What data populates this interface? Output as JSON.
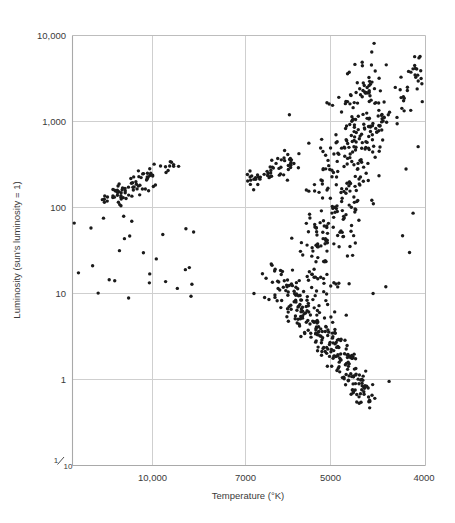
{
  "figure": {
    "background_color": "#ffffff",
    "point_color": "#1a1a1a",
    "grid_color": "#cfcfcf",
    "frame_color": "#b5b5b5",
    "point_radius": 1.7
  },
  "chart_data": {
    "type": "scatter",
    "title": "",
    "subtitle": "",
    "xlabel": "Temperature (°K)",
    "ylabel": "Luminosity (sun's luminosity = 1)",
    "xscale": "log-reversed",
    "yscale": "log",
    "xlim": [
      14500,
      3900
    ],
    "ylim": [
      0.1,
      10000
    ],
    "grid": true,
    "legend": null,
    "annotations": [],
    "xticks": [
      10000,
      7000,
      5000,
      4000
    ],
    "xticklabels": [
      "10,000",
      "7000",
      "5000",
      "4000"
    ],
    "yticks": [
      10000,
      1000,
      100,
      10,
      1,
      0.1
    ],
    "yticklabels": [
      "10,000",
      "1,000",
      "100",
      "10",
      "1",
      "1/10"
    ],
    "ytick_last_is_fraction": true,
    "ytick_fraction": {
      "numerator": "1",
      "denominator": "10"
    },
    "series_name": "stars",
    "n_points": 760,
    "clusters": [
      {
        "name": "horizontal-branch",
        "x_range": [
          11800,
          9500
        ],
        "y_range": [
          110,
          330
        ],
        "count": 78
      },
      {
        "name": "main-sequence-upper",
        "x_range": [
          7200,
          6200
        ],
        "y_range": [
          180,
          330
        ],
        "count": 52
      },
      {
        "name": "red-giant-branch",
        "x_range": [
          6100,
          4600
        ],
        "y_range": [
          8,
          1800
        ],
        "count": 300
      },
      {
        "name": "main-sequence-lower",
        "x_range": [
          6600,
          4800
        ],
        "y_range": [
          0.45,
          20
        ],
        "count": 250
      },
      {
        "name": "bright-red-giants",
        "x_range": [
          4700,
          3950
        ],
        "y_range": [
          500,
          5200
        ],
        "count": 45
      },
      {
        "name": "scattered-subdwarfs",
        "x_range": [
          14200,
          8800
        ],
        "y_range": [
          8,
          80
        ],
        "count": 35
      }
    ]
  }
}
